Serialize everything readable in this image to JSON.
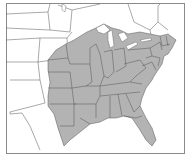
{
  "map": {
    "title": "",
    "region": "Eastern United States",
    "colors": {
      "range_fill": "#b3b3b3",
      "outside_fill": "#ffffff",
      "border": "#555555",
      "frame": "#8a8a8a"
    },
    "shaded_area_label": "Distribution range (eastern and central US)"
  }
}
